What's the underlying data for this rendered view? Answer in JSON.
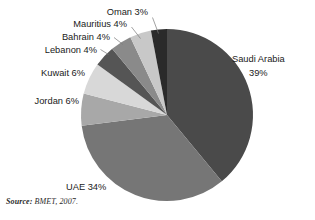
{
  "chart_data": {
    "type": "pie",
    "title": "",
    "xlabel": "",
    "ylabel": "",
    "unit": "%",
    "start_angle_deg": 0,
    "direction": "clockwise",
    "legend": "none",
    "grid": false,
    "labels_outside": true,
    "categories": [
      "Saudi Arabia",
      "UAE",
      "Jordan",
      "Kuwait",
      "Lebanon",
      "Bahrain",
      "Mauritius",
      "Oman"
    ],
    "values": [
      39,
      34,
      6,
      6,
      4,
      4,
      4,
      3
    ],
    "colors": [
      "#4a4a4a",
      "#767676",
      "#a8a8a8",
      "#d8d8d8",
      "#555555",
      "#8a8a8a",
      "#c8c8c8",
      "#2a2a2a"
    ],
    "slices": [
      {
        "name": "Saudi Arabia",
        "value": 39,
        "label": "Saudi Arabia",
        "value_label": "39%",
        "color": "#4a4a4a"
      },
      {
        "name": "UAE",
        "value": 34,
        "label": "UAE 34%",
        "value_label": "34%",
        "color": "#767676"
      },
      {
        "name": "Jordan",
        "value": 6,
        "label": "Jordan 6%",
        "value_label": "6%",
        "color": "#a8a8a8"
      },
      {
        "name": "Kuwait",
        "value": 6,
        "label": "Kuwait 6%",
        "value_label": "6%",
        "color": "#d8d8d8"
      },
      {
        "name": "Lebanon",
        "value": 4,
        "label": "Lebanon 4%",
        "value_label": "4%",
        "color": "#555555"
      },
      {
        "name": "Bahrain",
        "value": 4,
        "label": "Bahrain 4%",
        "value_label": "4%",
        "color": "#8a8a8a"
      },
      {
        "name": "Mauritius",
        "value": 4,
        "label": "Mauritius 4%",
        "value_label": "4%",
        "color": "#c8c8c8"
      },
      {
        "name": "Oman",
        "value": 3,
        "label": "Oman 3%",
        "value_label": "3%",
        "color": "#2a2a2a"
      }
    ]
  },
  "labels": {
    "oman": "Oman 3%",
    "mauritius": "Mauritius 4%",
    "bahrain": "Bahrain 4%",
    "lebanon": "Lebanon 4%",
    "kuwait": "Kuwait 6%",
    "jordan": "Jordan 6%",
    "uae": "UAE 34%",
    "saudi_line1": "Saudi Arabia",
    "saudi_line2": "39%"
  },
  "source": {
    "label": "Source:",
    "value": "BMET, 2007."
  }
}
